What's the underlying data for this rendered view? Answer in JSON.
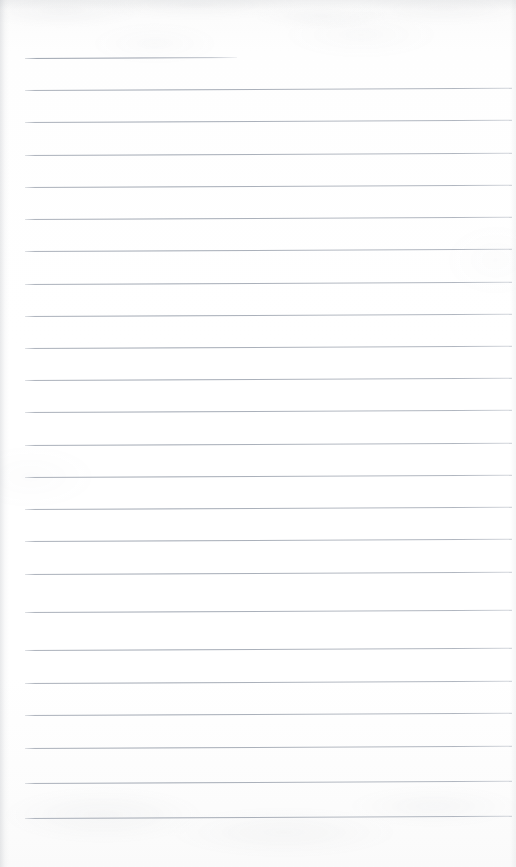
{
  "document": {
    "kind": "scanned-lined-paper",
    "title": "Blank lined notebook page",
    "page_width": 516,
    "page_height": 867,
    "paper_color": "#fdfdfd",
    "rule_color": "#a8aeb8",
    "content_text": "",
    "is_blank": true
  },
  "ruling": {
    "line_count": 24,
    "first_line_y": 58,
    "line_spacing": 32.2,
    "line_thickness": 1,
    "left_margin_x": 25,
    "right_edge_x": 512,
    "skew_degrees": -0.26,
    "lines": [
      {
        "index": 1,
        "y": 58,
        "x_start": 25,
        "x_end": 237,
        "truncated": true
      },
      {
        "index": 2,
        "y": 90,
        "x_start": 25,
        "x_end": 512,
        "truncated": false
      },
      {
        "index": 3,
        "y": 122,
        "x_start": 25,
        "x_end": 512,
        "truncated": false
      },
      {
        "index": 4,
        "y": 155,
        "x_start": 25,
        "x_end": 512,
        "truncated": false
      },
      {
        "index": 5,
        "y": 187,
        "x_start": 25,
        "x_end": 512,
        "truncated": false
      },
      {
        "index": 6,
        "y": 219,
        "x_start": 25,
        "x_end": 512,
        "truncated": false
      },
      {
        "index": 7,
        "y": 251,
        "x_start": 25,
        "x_end": 512,
        "truncated": false
      },
      {
        "index": 8,
        "y": 284,
        "x_start": 25,
        "x_end": 512,
        "truncated": false
      },
      {
        "index": 9,
        "y": 316,
        "x_start": 25,
        "x_end": 512,
        "truncated": false
      },
      {
        "index": 10,
        "y": 348,
        "x_start": 25,
        "x_end": 512,
        "truncated": false
      },
      {
        "index": 11,
        "y": 380,
        "x_start": 25,
        "x_end": 512,
        "truncated": false
      },
      {
        "index": 12,
        "y": 412,
        "x_start": 25,
        "x_end": 512,
        "truncated": false
      },
      {
        "index": 13,
        "y": 445,
        "x_start": 25,
        "x_end": 512,
        "truncated": false
      },
      {
        "index": 14,
        "y": 477,
        "x_start": 25,
        "x_end": 512,
        "truncated": false
      },
      {
        "index": 15,
        "y": 509,
        "x_start": 25,
        "x_end": 512,
        "truncated": false
      },
      {
        "index": 16,
        "y": 541,
        "x_start": 25,
        "x_end": 512,
        "truncated": false
      },
      {
        "index": 17,
        "y": 574,
        "x_start": 25,
        "x_end": 512,
        "truncated": false
      },
      {
        "index": 18,
        "y": 612,
        "x_start": 25,
        "x_end": 512,
        "truncated": false
      },
      {
        "index": 19,
        "y": 650,
        "x_start": 25,
        "x_end": 512,
        "truncated": false
      },
      {
        "index": 20,
        "y": 683,
        "x_start": 25,
        "x_end": 512,
        "truncated": false
      },
      {
        "index": 21,
        "y": 715,
        "x_start": 25,
        "x_end": 512,
        "truncated": false
      },
      {
        "index": 22,
        "y": 748,
        "x_start": 25,
        "x_end": 512,
        "truncated": false
      },
      {
        "index": 23,
        "y": 783,
        "x_start": 25,
        "x_end": 512,
        "truncated": false
      },
      {
        "index": 24,
        "y": 818,
        "x_start": 25,
        "x_end": 512,
        "truncated": false
      }
    ]
  }
}
